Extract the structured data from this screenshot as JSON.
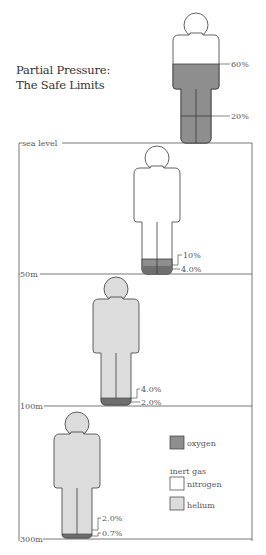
{
  "title": {
    "line1": "Partial Pressure:",
    "line2": "The Safe Limits"
  },
  "colors": {
    "oxygen": "#8e8e8e",
    "oxygen_dark": "#6f6f6f",
    "nitrogen": "#ffffff",
    "helium": "#dcdcdc",
    "outline": "#3a3a3a",
    "frame": "#555555"
  },
  "depth_markers": [
    {
      "label": "sea level"
    },
    {
      "label": "50m"
    },
    {
      "label": "100m"
    },
    {
      "label": "300m"
    }
  ],
  "figures": [
    {
      "name": "surface-reference",
      "gas": "nitrogen",
      "upper_label": "60%",
      "lower_label": "20%"
    },
    {
      "name": "sea-level-to-50m",
      "gas": "nitrogen",
      "upper_label": "10%",
      "lower_label": "4.0%"
    },
    {
      "name": "50m-to-100m",
      "gas": "helium",
      "upper_label": "4.0%",
      "lower_label": "2.0%"
    },
    {
      "name": "100m-to-300m",
      "gas": "helium",
      "upper_label": "2.0%",
      "lower_label": "0.7%"
    }
  ],
  "legend": {
    "oxygen": "oxygen",
    "inert_heading": "inert gas",
    "nitrogen": "nitrogen",
    "helium": "helium"
  }
}
